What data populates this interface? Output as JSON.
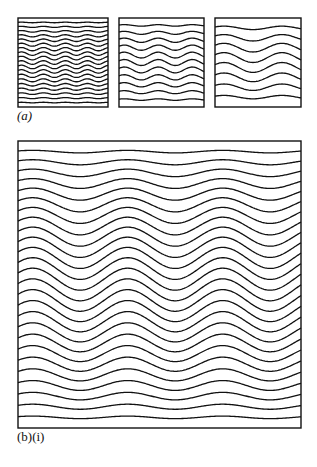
{
  "figure": {
    "labels": {
      "a": "(a)",
      "b": "(b)(i)"
    },
    "stroke_color": "#111111",
    "background": "#ffffff"
  },
  "panels": [
    {
      "id": "a1",
      "x": 17,
      "y": 17,
      "w": 90,
      "h": 89,
      "lines": 19,
      "period": 22,
      "amp": 1.8,
      "profile": "mid"
    },
    {
      "id": "a2",
      "x": 118,
      "y": 17,
      "w": 85,
      "h": 89,
      "lines": 11,
      "period": 34,
      "amp": 3.0,
      "profile": "mid"
    },
    {
      "id": "a3",
      "x": 214,
      "y": 17,
      "w": 86,
      "h": 89,
      "lines": 8,
      "period": 58,
      "amp": 5.0,
      "profile": "mid"
    },
    {
      "id": "b1",
      "x": 17,
      "y": 140,
      "w": 283,
      "h": 287,
      "lines": 26,
      "period": 95,
      "amp": 11,
      "profile": "mid"
    }
  ]
}
